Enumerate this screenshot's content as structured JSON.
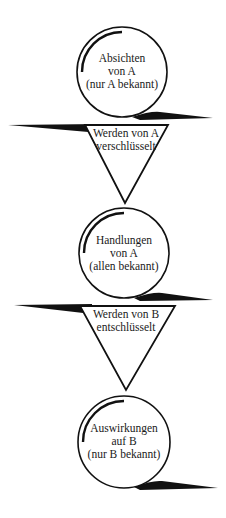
{
  "diagram": {
    "type": "flow",
    "colors": {
      "stroke": "#111111",
      "background": "#ffffff",
      "text": "#1a1a1a"
    },
    "nodes": [
      {
        "id": "n1",
        "shape": "circle",
        "lines": [
          "Absichten",
          "von A",
          "(nur A bekannt)"
        ]
      },
      {
        "id": "t1",
        "shape": "triangle",
        "lines": [
          "Werden von A",
          "verschlüsselt"
        ]
      },
      {
        "id": "n2",
        "shape": "circle",
        "lines": [
          "Handlungen",
          "von A",
          "(allen bekannt)"
        ]
      },
      {
        "id": "t2",
        "shape": "triangle",
        "lines": [
          "Werden von B",
          "entschlüsselt"
        ]
      },
      {
        "id": "n3",
        "shape": "circle",
        "lines": [
          "Auswirkungen",
          "auf B",
          "(nur B bekannt)"
        ]
      }
    ],
    "edges": [
      {
        "from": "n1",
        "to": "t1"
      },
      {
        "from": "t1",
        "to": "n2"
      },
      {
        "from": "n2",
        "to": "t2"
      },
      {
        "from": "t2",
        "to": "n3"
      }
    ]
  }
}
